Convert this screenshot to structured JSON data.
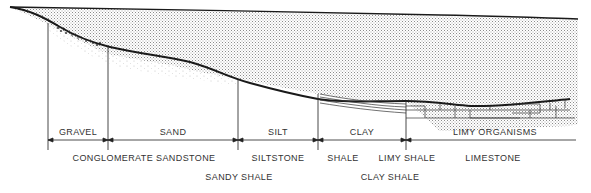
{
  "diagram": {
    "type": "sedimentary-facies-cross-section",
    "colors": {
      "line": "#1a1a1a",
      "water_stipple": "#9a9a9a",
      "sediment_dots": "#b0b0b0"
    },
    "sediment_classes": [
      {
        "id": "gravel",
        "label": "GRAVEL",
        "x": 78
      },
      {
        "id": "sand",
        "label": "SAND",
        "x": 173
      },
      {
        "id": "silt",
        "label": "SILT",
        "x": 278
      },
      {
        "id": "clay",
        "label": "CLAY",
        "x": 362
      },
      {
        "id": "limy",
        "label": "LIMY ORGANISMS",
        "x": 495
      }
    ],
    "rock_types_row1": [
      {
        "label": "CONGLOMERATE SANDSTONE",
        "x": 144
      },
      {
        "label": "SILTSTONE",
        "x": 278
      },
      {
        "label": "SHALE",
        "x": 343
      },
      {
        "label": "LIMY SHALE",
        "x": 407
      },
      {
        "label": "LIMESTONE",
        "x": 493
      }
    ],
    "rock_types_row2": [
      {
        "label": "SANDY SHALE",
        "x": 239
      },
      {
        "label": "CLAY SHALE",
        "x": 390
      }
    ]
  }
}
